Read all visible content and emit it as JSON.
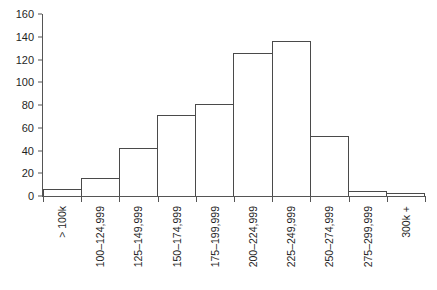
{
  "chart_data": {
    "type": "bar",
    "title": "",
    "subtitle": "",
    "xlabel": "",
    "ylabel": "",
    "categories": [
      "> 100k",
      "100–124,999",
      "125–149,999",
      "150–174,999",
      "175–199,999",
      "200–224,999",
      "225–249,999",
      "250–274,999",
      "275–299,999",
      "300k +"
    ],
    "values": [
      6,
      16,
      42,
      71,
      81,
      126,
      136,
      53,
      4,
      3
    ],
    "ylim": [
      0,
      160
    ],
    "ytick_labels": [
      "160",
      "140",
      "120",
      "100",
      "80",
      "60",
      "40",
      "20",
      "0"
    ],
    "ytick_values": [
      160,
      140,
      120,
      100,
      80,
      60,
      40,
      20,
      0
    ],
    "grid": false,
    "legend": false,
    "legend_position": "none",
    "bar_fill_color": "#ffffff",
    "bar_outline_color": "#4a4a4a",
    "axis_color": "#555555",
    "background_color": "#ffffff",
    "bar_gap": 0,
    "xtick_label_rotation": -90
  }
}
